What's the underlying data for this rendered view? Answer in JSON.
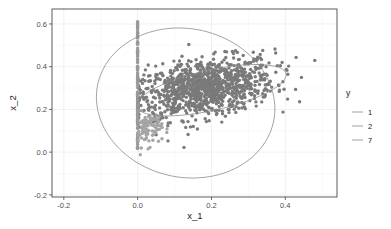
{
  "chart_data": {
    "type": "scatter",
    "title": "",
    "xlabel": "x_1",
    "ylabel": "x_2",
    "xlim": [
      -0.232,
      0.54
    ],
    "ylim": [
      -0.21,
      0.67
    ],
    "x_ticks": [
      -0.2,
      0.0,
      0.2,
      0.4
    ],
    "x_tick_labels": [
      "-0.2",
      "0.0",
      "0.2",
      "0.4"
    ],
    "y_ticks": [
      -0.2,
      0.0,
      0.2,
      0.4,
      0.6
    ],
    "y_tick_labels": [
      "-0.2",
      "0.0",
      "0.2",
      "0.4",
      "0.6"
    ],
    "grid": true,
    "legend": {
      "title": "y",
      "position": "right",
      "entries": [
        "1",
        "2",
        "7"
      ]
    },
    "series": [
      {
        "name": "2",
        "description": "main cloud of points",
        "color": "#7a7a7a",
        "n": 1100,
        "center": [
          0.18,
          0.3
        ],
        "sd": [
          0.095,
          0.07
        ],
        "corr": 0.35,
        "x_min": 0.0
      },
      {
        "name": "1",
        "description": "points stacked on x_1 = 0",
        "color": "#9a9a9a",
        "n": 120,
        "x": 0.0,
        "y_range": [
          0.0,
          0.62
        ]
      },
      {
        "name": "7",
        "description": "lighter cluster near origin",
        "color": "#a5a5a5",
        "n": 90,
        "center": [
          0.03,
          0.11
        ],
        "sd": [
          0.018,
          0.04
        ],
        "corr": 0.1,
        "x_min": 0.0
      }
    ],
    "ellipses": [
      {
        "name": "1",
        "cx": 0.13,
        "cy": 0.23,
        "rx_axis": [
          0.22,
          0.12
        ],
        "ry_axis": [
          -0.1,
          0.33
        ],
        "note": "large outer ellipse",
        "color": "#8c8c8c"
      },
      {
        "name": "2",
        "cx": 0.2,
        "cy": 0.29,
        "rx_axis": [
          0.2,
          0.085
        ],
        "ry_axis": [
          -0.03,
          0.085
        ],
        "note": "inner ellipse",
        "color": "#8c8c8c"
      }
    ]
  }
}
